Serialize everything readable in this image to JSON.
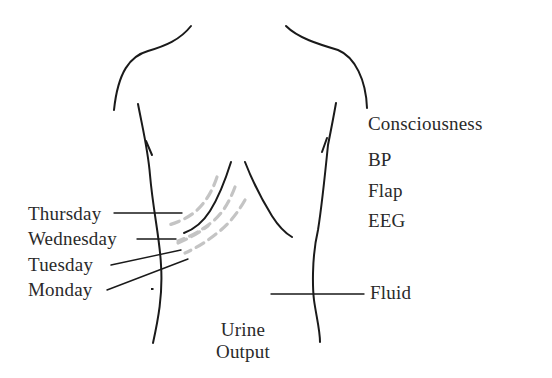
{
  "figure": {
    "left_labels": [
      {
        "id": "thursday",
        "text": "Thursday"
      },
      {
        "id": "wednesday",
        "text": "Wednesday"
      },
      {
        "id": "tuesday",
        "text": "Tuesday"
      },
      {
        "id": "monday",
        "text": "Monday"
      }
    ],
    "right_labels": [
      {
        "id": "consciousness",
        "text": "Consciousness"
      },
      {
        "id": "bp",
        "text": "BP"
      },
      {
        "id": "flap",
        "text": "Flap"
      },
      {
        "id": "eeg",
        "text": "EEG"
      },
      {
        "id": "fluid",
        "text": "Fluid"
      }
    ],
    "bottom_label": {
      "line1": "Urine",
      "line2": "Output"
    },
    "colors": {
      "outline": "#1a1a1a",
      "dashed_margin": "#c4c4c4",
      "text": "#2a2a2a",
      "background": "#ffffff"
    }
  }
}
